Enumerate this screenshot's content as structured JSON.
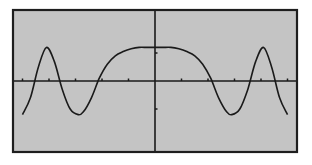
{
  "calculator_screen": {
    "background_color": "#c4c4c4",
    "border_color": "#1e1e1e",
    "curve_color": "#1a1a1a",
    "axis_color": "#1a1a1a"
  },
  "chart_data": {
    "type": "line",
    "title": "",
    "xlabel": "",
    "ylabel": "",
    "grid": false,
    "legend": null,
    "axes": {
      "x_axis_visible": true,
      "y_axis_visible": true,
      "x_ticks_left": [
        -5,
        -4,
        -3,
        -2,
        -1
      ],
      "x_ticks_right": [
        1,
        2,
        3,
        4,
        5
      ],
      "y_ticks": [
        1,
        -1
      ]
    },
    "xlim": [
      -5.3,
      5.3
    ],
    "ylim": [
      -1.6,
      1.6
    ],
    "series": [
      {
        "name": "y1",
        "description": "Symmetric oscillating curve with flat plateau near x=0, peaks near x=±4.1, troughs near x=±2.8 and ±5.0",
        "x": [
          -5.0,
          -4.7,
          -4.4,
          -4.1,
          -3.8,
          -3.5,
          -3.2,
          -2.9,
          -2.7,
          -2.4,
          -2.1,
          -1.8,
          -1.5,
          -1.2,
          -0.9,
          -0.6,
          -0.3,
          0.0,
          0.3,
          0.6,
          0.9,
          1.2,
          1.5,
          1.8,
          2.1,
          2.4,
          2.7,
          2.9,
          3.2,
          3.5,
          3.8,
          4.1,
          4.4,
          4.7,
          5.0
        ],
        "y": [
          -1.2,
          -0.6,
          0.5,
          1.2,
          0.7,
          -0.3,
          -1.0,
          -1.2,
          -1.1,
          -0.6,
          0.1,
          0.6,
          0.9,
          1.05,
          1.15,
          1.2,
          1.2,
          1.2,
          1.2,
          1.2,
          1.15,
          1.05,
          0.9,
          0.6,
          0.1,
          -0.6,
          -1.1,
          -1.2,
          -1.0,
          -0.3,
          0.7,
          1.2,
          0.5,
          -0.6,
          -1.2
        ]
      }
    ]
  }
}
